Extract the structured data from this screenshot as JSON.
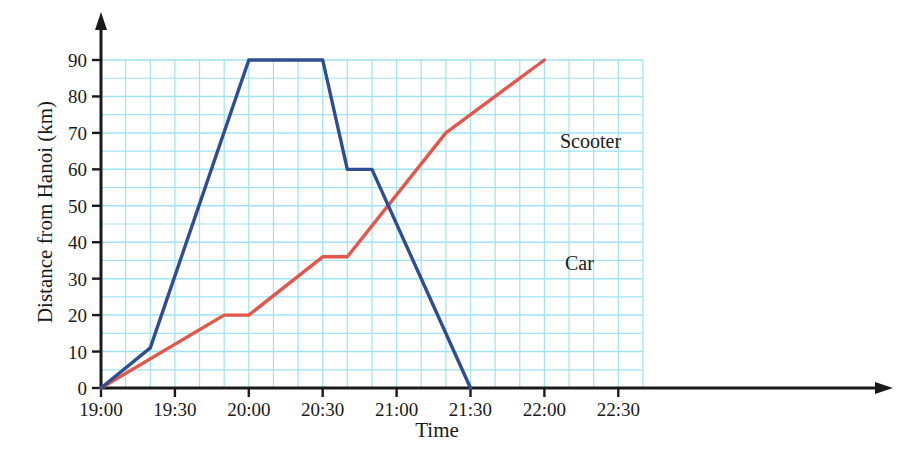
{
  "chart_data": {
    "type": "line",
    "title": "",
    "xlabel": "Time",
    "ylabel": "Distance from Hanoi (km)",
    "xlim": [
      "19:00",
      "22:40"
    ],
    "ylim": [
      0,
      95
    ],
    "grid": true,
    "grid_x_step_minutes": 10,
    "grid_y_step": 5,
    "legend_position": "inline-labels",
    "x_ticks": [
      "19:00",
      "19:30",
      "20:00",
      "20:30",
      "21:00",
      "21:30",
      "22:00",
      "22:30"
    ],
    "y_ticks": [
      "0",
      "10",
      "20",
      "30",
      "40",
      "50",
      "60",
      "70",
      "80",
      "90"
    ],
    "series": [
      {
        "name": "Car",
        "color": "#2f4d91",
        "label": "Car",
        "points": [
          {
            "x": "19:00",
            "y": 0
          },
          {
            "x": "19:20",
            "y": 11
          },
          {
            "x": "20:00",
            "y": 90
          },
          {
            "x": "20:30",
            "y": 90
          },
          {
            "x": "20:40",
            "y": 60
          },
          {
            "x": "20:50",
            "y": 60
          },
          {
            "x": "21:30",
            "y": 0
          }
        ]
      },
      {
        "name": "Scooter",
        "color": "#e2574a",
        "label": "Scooter",
        "points": [
          {
            "x": "19:00",
            "y": 0
          },
          {
            "x": "19:50",
            "y": 20
          },
          {
            "x": "20:00",
            "y": 20
          },
          {
            "x": "20:30",
            "y": 36
          },
          {
            "x": "20:40",
            "y": 36
          },
          {
            "x": "21:20",
            "y": 70
          },
          {
            "x": "22:00",
            "y": 90
          }
        ]
      }
    ]
  },
  "axes": {
    "x_label": "Time",
    "y_label": "Distance from Hanoi (km)",
    "x_ticks": [
      "19:00",
      "19:30",
      "20:00",
      "20:30",
      "21:00",
      "21:30",
      "22:00",
      "22:30"
    ],
    "y_ticks": [
      "90",
      "80",
      "70",
      "60",
      "50",
      "40",
      "30",
      "20",
      "10",
      "0"
    ]
  },
  "annotations": [
    {
      "text": "Scooter",
      "series": "Scooter"
    },
    {
      "text": "Car",
      "series": "Car"
    }
  ],
  "colors": {
    "car_line": "#2f4d91",
    "scooter_line": "#e2574a",
    "grid": "#9fe3f5",
    "axis": "#1a1a1a",
    "background": "#ffffff"
  }
}
